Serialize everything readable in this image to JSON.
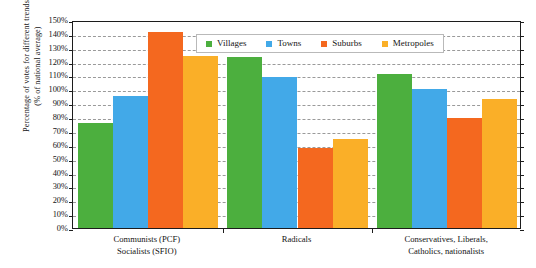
{
  "chart_data": {
    "type": "bar",
    "title": "",
    "xlabel": "",
    "ylabel": "Percentage of votes for different trends (% of national average)",
    "ylabel_line1": "Percentage of votes for different trends",
    "ylabel_line2": "(% of national average)",
    "ylim": [
      0,
      150
    ],
    "ytick_step": 10,
    "ytick_labels": [
      "150%",
      "140%",
      "130%",
      "120%",
      "110%",
      "100%",
      "90%",
      "80%",
      "70%",
      "60%",
      "50%",
      "40%",
      "30%",
      "20%",
      "10%",
      "0%"
    ],
    "ytick_values": [
      150,
      140,
      130,
      120,
      110,
      100,
      90,
      80,
      70,
      60,
      50,
      40,
      30,
      20,
      10,
      0
    ],
    "grid": true,
    "grid_style": "dashed-horizontal",
    "legend_position": "top-center-inside",
    "categories": [
      "Communists (PCF) Socialists (SFIO)",
      "Radicals",
      "Conservatives, Liberals, Catholics, nationalists"
    ],
    "category_lines": [
      [
        "Communists (PCF)",
        "Socialists (SFIO)"
      ],
      [
        "Radicals"
      ],
      [
        "Conservatives, Liberals,",
        "Catholics, nationalists"
      ]
    ],
    "series": [
      {
        "name": "Villages",
        "color": "#4CAF3E",
        "values": [
          76,
          123,
          111
        ]
      },
      {
        "name": "Towns",
        "color": "#42A9E8",
        "values": [
          95,
          109,
          100
        ]
      },
      {
        "name": "Suburbs",
        "color": "#F4681F",
        "values": [
          141,
          58,
          79
        ]
      },
      {
        "name": "Metropoles",
        "color": "#FAAF28",
        "values": [
          124,
          64,
          93
        ]
      }
    ]
  }
}
